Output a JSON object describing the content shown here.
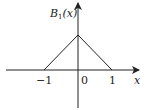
{
  "diagram": {
    "title": "",
    "y_label_main": "B",
    "y_label_sub": "1",
    "y_label_arg": "(x)",
    "x_label": "x",
    "ticks": [
      {
        "label": "−1",
        "value": -1
      },
      {
        "label": "0",
        "value": 0
      },
      {
        "label": "1",
        "value": 1
      }
    ],
    "function": {
      "name": "B1(x)",
      "type": "hat (piecewise linear)",
      "points": [
        [
          -1,
          0
        ],
        [
          0,
          1
        ],
        [
          1,
          0
        ]
      ]
    }
  }
}
